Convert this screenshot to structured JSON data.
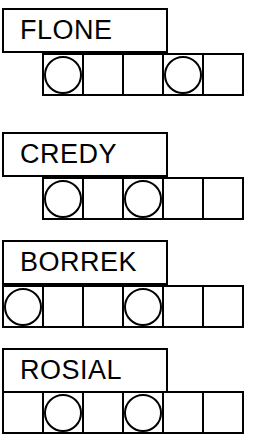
{
  "worksheet": {
    "cell_size": 42,
    "colors": {
      "stroke": "#000000",
      "fill": "#ffffff"
    },
    "groups": [
      {
        "label": "FLONE",
        "label_top": 8,
        "row_top": 53,
        "row_left": 42,
        "cell_count": 5,
        "circle_positions": [
          1,
          4
        ],
        "cells": [
          {
            "index": 1,
            "has_circle": true,
            "letter": ""
          },
          {
            "index": 2,
            "has_circle": false,
            "letter": ""
          },
          {
            "index": 3,
            "has_circle": false,
            "letter": ""
          },
          {
            "index": 4,
            "has_circle": true,
            "letter": ""
          },
          {
            "index": 5,
            "has_circle": false,
            "letter": ""
          }
        ]
      },
      {
        "label": "CREDY",
        "label_top": 132,
        "row_top": 177,
        "row_left": 42,
        "cell_count": 5,
        "circle_positions": [
          1,
          3
        ],
        "cells": [
          {
            "index": 1,
            "has_circle": true,
            "letter": ""
          },
          {
            "index": 2,
            "has_circle": false,
            "letter": ""
          },
          {
            "index": 3,
            "has_circle": true,
            "letter": ""
          },
          {
            "index": 4,
            "has_circle": false,
            "letter": ""
          },
          {
            "index": 5,
            "has_circle": false,
            "letter": ""
          }
        ]
      },
      {
        "label": "BORREK",
        "label_top": 240,
        "row_top": 285,
        "row_left": 2,
        "cell_count": 6,
        "circle_positions": [
          1,
          4
        ],
        "cells": [
          {
            "index": 1,
            "has_circle": true,
            "letter": ""
          },
          {
            "index": 2,
            "has_circle": false,
            "letter": ""
          },
          {
            "index": 3,
            "has_circle": false,
            "letter": ""
          },
          {
            "index": 4,
            "has_circle": true,
            "letter": ""
          },
          {
            "index": 5,
            "has_circle": false,
            "letter": ""
          },
          {
            "index": 6,
            "has_circle": false,
            "letter": ""
          }
        ]
      },
      {
        "label": "ROSIAL",
        "label_top": 348,
        "row_top": 391,
        "row_left": 2,
        "cell_count": 6,
        "circle_positions": [
          2,
          4
        ],
        "cells": [
          {
            "index": 1,
            "has_circle": false,
            "letter": ""
          },
          {
            "index": 2,
            "has_circle": true,
            "letter": ""
          },
          {
            "index": 3,
            "has_circle": false,
            "letter": ""
          },
          {
            "index": 4,
            "has_circle": true,
            "letter": ""
          },
          {
            "index": 5,
            "has_circle": false,
            "letter": ""
          },
          {
            "index": 6,
            "has_circle": false,
            "letter": ""
          }
        ]
      }
    ]
  }
}
